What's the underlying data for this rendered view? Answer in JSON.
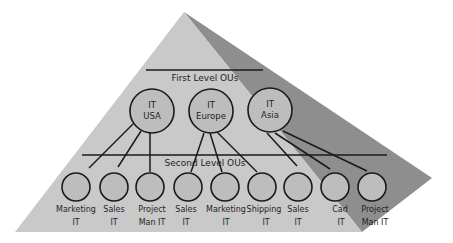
{
  "diagram": {
    "type": "organizational-unit-hierarchy-pyramid",
    "colors": {
      "background": "#ffffff",
      "pyramid_light_face": "#c9c9c9",
      "pyramid_dark_face": "#8e8e8e",
      "node_fill": "#bdbdbd",
      "line": "#1a1a1a",
      "text": "#1f1f1f"
    },
    "levels": {
      "first": {
        "label": "First Level OUs"
      },
      "second": {
        "label": "Second Level OUs"
      }
    },
    "first_level_nodes": [
      {
        "id": "usa",
        "line1": "IT",
        "line2": "USA"
      },
      {
        "id": "europe",
        "line1": "IT",
        "line2": "Europe"
      },
      {
        "id": "asia",
        "line1": "IT",
        "line2": "Asia"
      }
    ],
    "second_level_nodes": [
      {
        "parent": "usa",
        "line1": "Marketing",
        "line2": "IT"
      },
      {
        "parent": "usa",
        "line1": "Sales",
        "line2": "IT"
      },
      {
        "parent": "usa",
        "line1": "Project",
        "line2": "Man IT"
      },
      {
        "parent": "europe",
        "line1": "Sales",
        "line2": "IT"
      },
      {
        "parent": "europe",
        "line1": "Marketing",
        "line2": "IT"
      },
      {
        "parent": "europe",
        "line1": "Shipping",
        "line2": "IT"
      },
      {
        "parent": "asia",
        "line1": "Sales",
        "line2": "IT"
      },
      {
        "parent": "asia",
        "line1": "Cad",
        "line2": "IT"
      },
      {
        "parent": "asia",
        "line1": "Project",
        "line2": "Man IT"
      }
    ]
  }
}
